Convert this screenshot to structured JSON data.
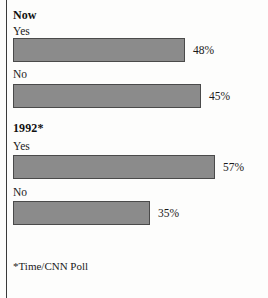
{
  "chart_data": {
    "type": "bar",
    "title": "",
    "orientation": "horizontal",
    "xlabel": "",
    "ylabel": "",
    "grid": false,
    "legend": "none",
    "xlim": [
      0,
      100
    ],
    "footnote": "*Time/CNN Poll",
    "groups": [
      {
        "name": "Now",
        "bars": [
          {
            "category": "Yes",
            "value": 48,
            "value_label": "48%",
            "pixel_width": 172
          },
          {
            "category": "No",
            "value": 45,
            "value_label": "45%",
            "pixel_width": 188
          }
        ]
      },
      {
        "name": "1992*",
        "bars": [
          {
            "category": "Yes",
            "value": 57,
            "value_label": "57%",
            "pixel_width": 202
          },
          {
            "category": "No",
            "value": 35,
            "value_label": "35%",
            "pixel_width": 137
          }
        ]
      }
    ],
    "categories": [
      "Now Yes",
      "Now No",
      "1992* Yes",
      "1992* No"
    ],
    "values": [
      48,
      45,
      57,
      35
    ],
    "colors": {
      "bar_fill": "#8b8b8b",
      "bar_border": "#4a4a4a",
      "text": "#1a1a1a",
      "rule": "#3a3a3a",
      "background": "#fdfdfc"
    }
  },
  "layout": {
    "group1": {
      "title_top": 8,
      "label1_top": 24,
      "bar1_top": 38,
      "label2_top": 68,
      "bar2_top": 84
    },
    "group2": {
      "title_top": 122,
      "label1_top": 140,
      "bar1_top": 155,
      "label2_top": 186,
      "bar2_top": 201
    },
    "footnote_top": 260
  }
}
